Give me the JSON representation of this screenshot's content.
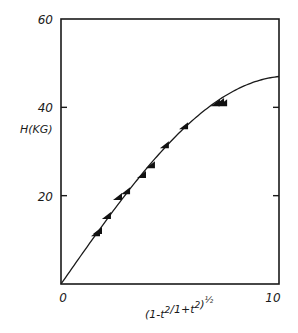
{
  "chart_data": {
    "type": "scatter",
    "title": "",
    "xlabel": "(1-t²/1+t²)½",
    "ylabel": "H(KG)",
    "xlim": [
      0,
      10
    ],
    "ylim": [
      0,
      60
    ],
    "grid": false,
    "legend": "none",
    "x_ticks": [
      {
        "value": 0,
        "label": "0"
      },
      {
        "value": 10,
        "label": "10"
      }
    ],
    "y_ticks": [
      {
        "value": 20,
        "label": "20"
      },
      {
        "value": 40,
        "label": "40"
      },
      {
        "value": 60,
        "label": "60"
      }
    ],
    "series": [
      {
        "name": "measured",
        "marker": "filled-triangle",
        "points": [
          [
            1.56,
            11.5
          ],
          [
            1.65,
            12.0
          ],
          [
            2.06,
            15.4
          ],
          [
            2.57,
            19.7
          ],
          [
            2.94,
            21.0
          ],
          [
            3.67,
            24.7
          ],
          [
            4.08,
            26.9
          ],
          [
            4.72,
            31.4
          ],
          [
            5.6,
            35.7
          ],
          [
            7.06,
            40.9
          ],
          [
            7.25,
            41.2
          ],
          [
            7.39,
            40.9
          ]
        ]
      },
      {
        "name": "fit-curve",
        "style": "solid-line",
        "function": "H = 47.1 * sin(0.15 * x)",
        "x": [
          0,
          1,
          2,
          3,
          4,
          5,
          6,
          7,
          8,
          9,
          10
        ],
        "values": [
          0,
          7.0,
          13.9,
          20.5,
          26.6,
          32.2,
          37.1,
          41.0,
          44.1,
          46.2,
          47.0
        ]
      }
    ]
  }
}
